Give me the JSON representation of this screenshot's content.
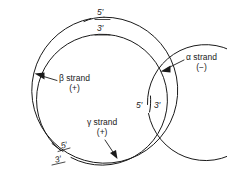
{
  "figure": {
    "background_color": "#ffffff",
    "line_color": "#1a1a1a"
  },
  "strands": [
    {
      "id": "alpha",
      "name": "alpha-strand",
      "label": "α strand",
      "polarity": "(−)",
      "ring": "outer",
      "five_prime": "5′",
      "three_prime": "3′",
      "break_position": "top"
    },
    {
      "id": "beta",
      "name": "beta-strand",
      "label": "β strand",
      "polarity": "(+)",
      "ring": "middle",
      "five_prime": "5′",
      "three_prime": "3′",
      "break_position": "bottom-left"
    },
    {
      "id": "gamma",
      "name": "gamma-strand",
      "label": "γ strand",
      "polarity": "(+)",
      "ring": "inner",
      "five_prime": "5′",
      "three_prime": "3′",
      "break_position": "right"
    }
  ],
  "labels": {
    "top_five_prime": "5′",
    "top_three_prime": "3′",
    "right_five_prime": "5′",
    "right_three_prime": "3′",
    "bottom_five_prime": "5′",
    "bottom_three_prime": "3′",
    "alpha_strand": "α strand",
    "alpha_sign": "(−)",
    "beta_strand": "β strand",
    "beta_sign": "(+)",
    "gamma_strand": "γ strand",
    "gamma_sign": "(+)"
  }
}
